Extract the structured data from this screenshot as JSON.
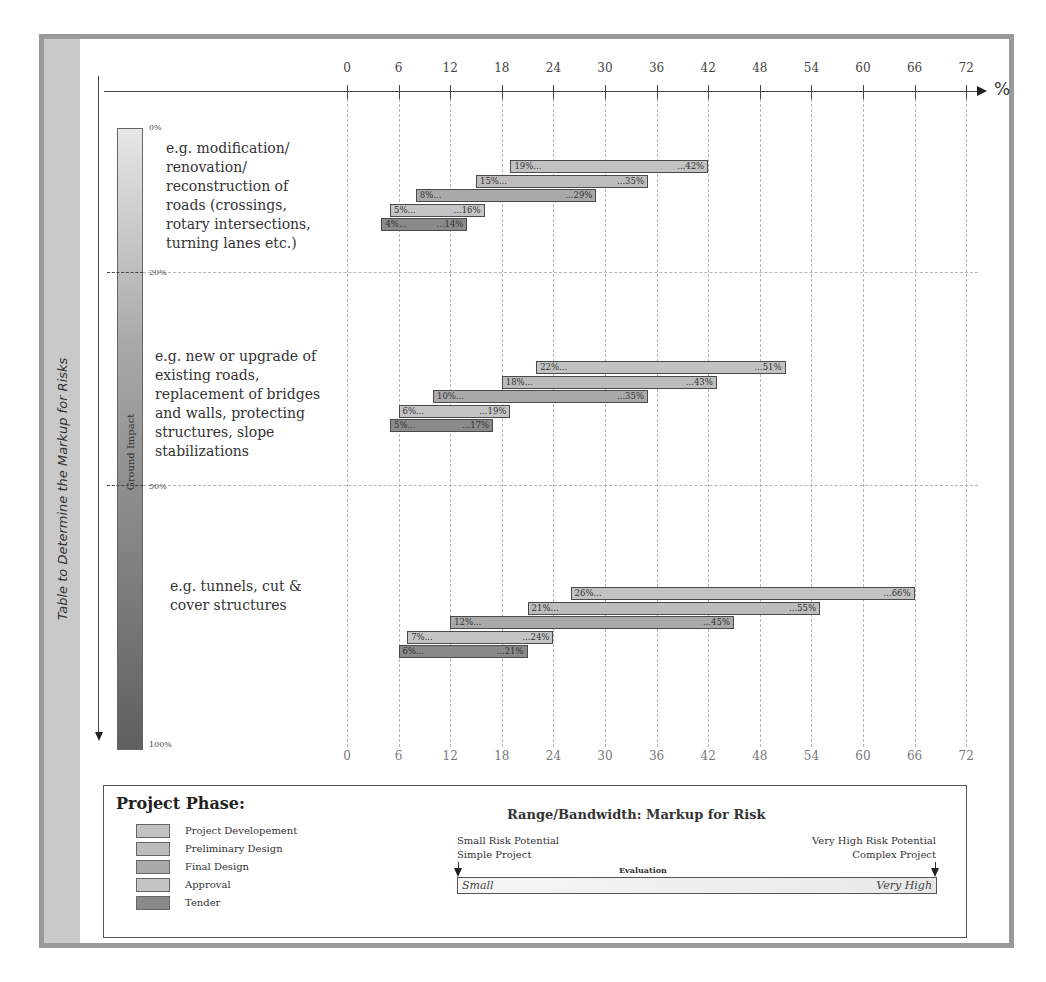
{
  "frame": {
    "side_title": "Table to Determine the Markup for Risks"
  },
  "axis": {
    "unit": "%",
    "ticks": [
      "0",
      "6",
      "12",
      "18",
      "24",
      "30",
      "36",
      "42",
      "48",
      "54",
      "60",
      "66",
      "72"
    ]
  },
  "ground_impact": {
    "label": "Ground Impact",
    "marks": [
      "0%",
      "20%",
      "50%",
      "100%"
    ]
  },
  "categories": [
    "e.g. modification/ renovation/ reconstruction of roads (crossings, rotary intersections, turning lanes etc.)",
    "e.g. new or upgrade of existing roads, replacement of bridges and walls, protecting structures, slope stabilizations",
    "e.g. tunnels, cut & cover structures"
  ],
  "category_lines": [
    [
      "e.g. modification/",
      "renovation/",
      "reconstruction of",
      "roads (crossings,",
      "rotary intersections,",
      "turning lanes etc.)"
    ],
    [
      "e.g. new or upgrade of",
      "existing roads,",
      "replacement of bridges",
      "and walls, protecting",
      "structures, slope",
      "stabilizations"
    ],
    [
      "e.g. tunnels, cut &",
      "cover structures"
    ]
  ],
  "legend": {
    "title": "Project Phase:",
    "items": [
      {
        "label": "Project Developement",
        "color": "#c2c2c2"
      },
      {
        "label": "Preliminary Design",
        "color": "#bcbcbc"
      },
      {
        "label": "Final Design",
        "color": "#a9a9a9"
      },
      {
        "label": "Approval",
        "color": "#c4c4c4"
      },
      {
        "label": "Tender",
        "color": "#8a8a8a"
      }
    ]
  },
  "range": {
    "title": "Range/Bandwidth: Markup for Risk",
    "left_note_1": "Small Risk Potential",
    "left_note_2": "Simple Project",
    "right_note_1": "Very High Risk Potential",
    "right_note_2": "Complex Project",
    "evaluation": "Evaluation",
    "scale_low": "Small",
    "scale_high": "Very High"
  },
  "chart_data": {
    "type": "bar",
    "orientation": "horizontal-range",
    "title": "Table to Determine the Markup for Risks",
    "xlabel": "%",
    "ylabel": "Ground Impact",
    "xlim": [
      0,
      72
    ],
    "xticks": [
      0,
      6,
      12,
      18,
      24,
      30,
      36,
      42,
      48,
      54,
      60,
      66,
      72
    ],
    "grid": true,
    "legend_position": "bottom-left",
    "groups": [
      {
        "category": "e.g. modification/renovation/reconstruction of roads (crossings, rotary intersections, turning lanes etc.)",
        "ground_impact_range": "0%-20%",
        "series": [
          {
            "name": "Project Developement",
            "low": 19,
            "high": 42
          },
          {
            "name": "Preliminary Design",
            "low": 15,
            "high": 35
          },
          {
            "name": "Final Design",
            "low": 8,
            "high": 29
          },
          {
            "name": "Approval",
            "low": 5,
            "high": 16
          },
          {
            "name": "Tender",
            "low": 4,
            "high": 14
          }
        ]
      },
      {
        "category": "e.g. new or upgrade of existing roads, replacement of bridges and walls, protecting structures, slope stabilizations",
        "ground_impact_range": "20%-50%",
        "series": [
          {
            "name": "Project Developement",
            "low": 22,
            "high": 51
          },
          {
            "name": "Preliminary Design",
            "low": 18,
            "high": 43
          },
          {
            "name": "Final Design",
            "low": 10,
            "high": 35
          },
          {
            "name": "Approval",
            "low": 6,
            "high": 19
          },
          {
            "name": "Tender",
            "low": 5,
            "high": 17
          }
        ]
      },
      {
        "category": "e.g. tunnels, cut & cover structures",
        "ground_impact_range": "50%-100%",
        "series": [
          {
            "name": "Project Developement",
            "low": 26,
            "high": 66
          },
          {
            "name": "Preliminary Design",
            "low": 21,
            "high": 55
          },
          {
            "name": "Final Design",
            "low": 12,
            "high": 45
          },
          {
            "name": "Approval",
            "low": 7,
            "high": 24
          },
          {
            "name": "Tender",
            "low": 6,
            "high": 21
          }
        ]
      }
    ]
  }
}
